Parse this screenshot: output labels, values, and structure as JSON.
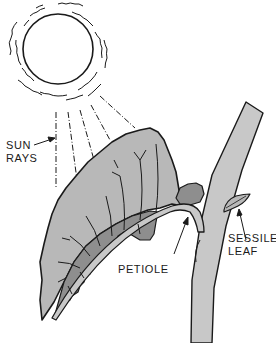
{
  "diagram": {
    "labels": {
      "sun_rays": {
        "line1": "SUN",
        "line2": "RAYS"
      },
      "petiole": "PETIOLE",
      "sessile_leaf": {
        "line1": "SESSILE",
        "line2": "LEAF"
      }
    },
    "colors": {
      "outline": "#1a1a1a",
      "leaf_light": "#b8b8b8",
      "leaf_dark": "#8e8e8e",
      "stem": "#c8c8c8",
      "background": "#ffffff"
    }
  }
}
